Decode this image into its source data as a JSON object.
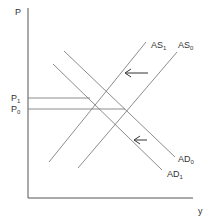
{
  "diagram": {
    "type": "AS-AD shift",
    "axes": {
      "y_label": "P",
      "x_label": "y"
    },
    "curves": {
      "AS1": {
        "base": "AS",
        "sub": "1"
      },
      "AS0": {
        "base": "AS",
        "sub": "0"
      },
      "AD0": {
        "base": "AD",
        "sub": "0"
      },
      "AD1": {
        "base": "AD",
        "sub": "1"
      }
    },
    "price_levels": {
      "P1": {
        "base": "P",
        "sub": "1"
      },
      "P0": {
        "base": "P",
        "sub": "0"
      }
    },
    "arrows": [
      "AS shift left arrow",
      "AD shift left arrow"
    ],
    "colors": {
      "line": "#6e6e6e",
      "axis": "#555555",
      "text": "#333333"
    }
  }
}
